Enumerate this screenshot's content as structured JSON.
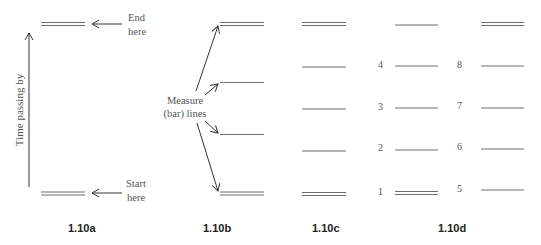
{
  "figures": {
    "a": {
      "caption": "1.10a",
      "axis_label": "Time passing by",
      "end_label_line1": "End",
      "end_label_line2": "here",
      "start_label_line1": "Start",
      "start_label_line2": "here"
    },
    "b": {
      "caption": "1.10b",
      "measure_label_line1": "Measure",
      "measure_label_line2": "(bar) lines"
    },
    "c": {
      "caption": "1.10c"
    },
    "d": {
      "caption": "1.10d",
      "left_numbers": [
        "4",
        "3",
        "2",
        "1"
      ],
      "right_numbers": [
        "8",
        "7",
        "6",
        "5"
      ]
    }
  },
  "colors": {
    "line": "#6e6e6e",
    "text": "#555555",
    "caption": "#222222"
  }
}
